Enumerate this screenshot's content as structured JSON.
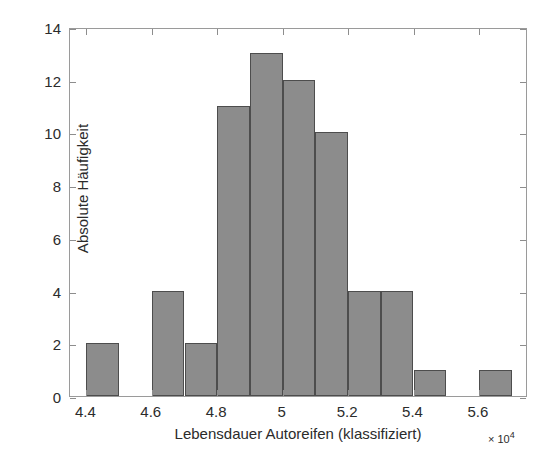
{
  "chart_data": {
    "type": "bar",
    "title": "",
    "subtitle": "",
    "xlabel": "Lebensdauer Autoreifen (klassifiziert)",
    "ylabel": "Absolute Häufigkeit",
    "x_multiplier_label": "× 10",
    "x_multiplier_exponent": "4",
    "grid": false,
    "legend": null,
    "xlim": [
      4.35,
      5.75
    ],
    "ylim": [
      0,
      14
    ],
    "xticks": [
      "4.4",
      "4.6",
      "4.8",
      "5",
      "5.2",
      "5.4",
      "5.6"
    ],
    "xtick_values": [
      4.4,
      4.6,
      4.8,
      5.0,
      5.2,
      5.4,
      5.6
    ],
    "yticks": [
      "0",
      "2",
      "4",
      "6",
      "8",
      "10",
      "12",
      "14"
    ],
    "ytick_values": [
      0,
      2,
      4,
      6,
      8,
      10,
      12,
      14
    ],
    "bin_width": 0.1,
    "bin_edges": [
      4.4,
      4.5,
      4.6,
      4.7,
      4.8,
      4.9,
      5.0,
      5.1,
      5.2,
      5.3,
      5.4,
      5.5,
      5.6,
      5.7
    ],
    "categories": [
      "4.4–4.5",
      "4.5–4.6",
      "4.6–4.7",
      "4.7–4.8",
      "4.8–4.9",
      "4.9–5.0",
      "5.0–5.1",
      "5.1–5.2",
      "5.2–5.3",
      "5.3–5.4",
      "5.4–5.5",
      "5.5–5.6",
      "5.6–5.7"
    ],
    "values": [
      2,
      0,
      4,
      2,
      11,
      13,
      12,
      10,
      4,
      4,
      1,
      0,
      1
    ],
    "bars": [
      {
        "x0": 4.4,
        "x1": 4.5,
        "value": 2
      },
      {
        "x0": 4.5,
        "x1": 4.6,
        "value": 0
      },
      {
        "x0": 4.6,
        "x1": 4.7,
        "value": 4
      },
      {
        "x0": 4.7,
        "x1": 4.8,
        "value": 2
      },
      {
        "x0": 4.8,
        "x1": 4.9,
        "value": 11
      },
      {
        "x0": 4.9,
        "x1": 5.0,
        "value": 13
      },
      {
        "x0": 5.0,
        "x1": 5.1,
        "value": 12
      },
      {
        "x0": 5.1,
        "x1": 5.2,
        "value": 10
      },
      {
        "x0": 5.2,
        "x1": 5.3,
        "value": 4
      },
      {
        "x0": 5.3,
        "x1": 5.4,
        "value": 4
      },
      {
        "x0": 5.4,
        "x1": 5.5,
        "value": 1
      },
      {
        "x0": 5.5,
        "x1": 5.6,
        "value": 0
      },
      {
        "x0": 5.6,
        "x1": 5.7,
        "value": 1
      }
    ],
    "colors": {
      "bar_fill": "#8c8c8c",
      "bar_edge": "#4d4d4d",
      "axis": "#9a9a9a",
      "text": "#2b2b2b",
      "background": "#ffffff"
    }
  }
}
